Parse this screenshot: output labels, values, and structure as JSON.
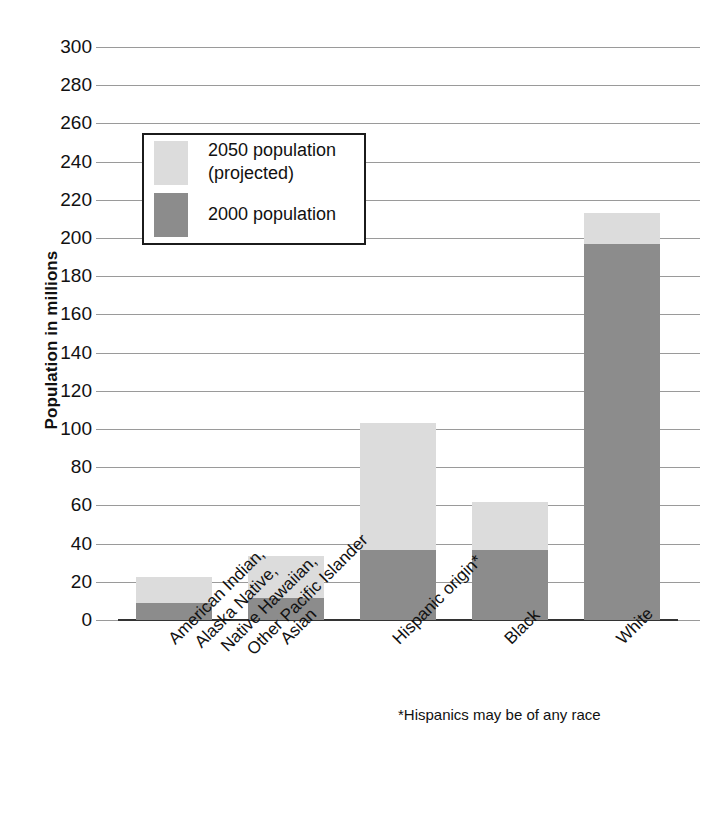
{
  "chart_data": {
    "type": "bar",
    "subtype": "stacked",
    "title": "",
    "xlabel": "",
    "ylabel": "Population in millions",
    "ylim": [
      0,
      300
    ],
    "ytick_step": 20,
    "yticks": [
      0,
      20,
      40,
      60,
      80,
      100,
      120,
      140,
      160,
      180,
      200,
      220,
      240,
      260,
      280,
      300
    ],
    "grid": true,
    "legend_position": "upper-left-inside",
    "categories": [
      "American Indian, Alaska Native, Native Hawaiian, Other Pacific Islander",
      "Asian",
      "Hispanic origin*",
      "Black",
      "White"
    ],
    "category_lines": [
      [
        "American Indian,",
        "Alaska Native,",
        "Native Hawaiian,",
        "Other Pacific Islander"
      ],
      [
        "Asian"
      ],
      [
        "Hispanic origin*"
      ],
      [
        "Black"
      ],
      [
        "White"
      ]
    ],
    "series": [
      {
        "name": "2000 population",
        "color": "#8c8c8c",
        "values": [
          9,
          11.5,
          36.5,
          36.5,
          197
        ]
      },
      {
        "name": "2050 population (projected)",
        "color": "#dcdcdc",
        "values": [
          22.5,
          33.5,
          103,
          62,
          213
        ],
        "note": "values are cumulative bar tops (total 2050 projection)"
      }
    ],
    "annotations": [
      "*Hispanics may be of any race"
    ]
  },
  "legend": {
    "items": [
      {
        "label_line1": "2050 population",
        "label_line2": "(projected)",
        "swatch": "light-gray-swatch"
      },
      {
        "label_line1": "2000 population",
        "label_line2": "",
        "swatch": "dark-gray-swatch"
      }
    ]
  },
  "axis": {
    "y_title": "Population in millions",
    "y_tick_labels": [
      "300",
      "280",
      "260",
      "240",
      "220",
      "200",
      "180",
      "160",
      "140",
      "120",
      "100",
      "80",
      "60",
      "40",
      "20",
      "0"
    ]
  },
  "footnote": {
    "text": "*Hispanics may be of any race"
  },
  "colors": {
    "light_gray": "#dcdcdc",
    "dark_gray": "#8c8c8c",
    "gridline": "#9a9a9a",
    "axis": "#333333",
    "text": "#111111",
    "background": "#ffffff"
  }
}
